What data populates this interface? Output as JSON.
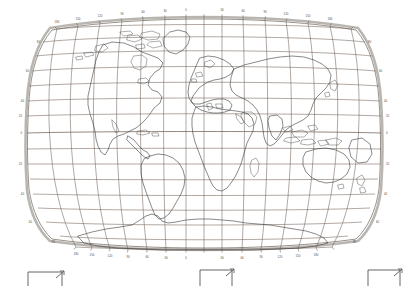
{
  "map": {
    "title": "World Map",
    "projection": "Robinson",
    "background_color": "#ffffff",
    "graticule_color": "#6b5a4e",
    "coastline_color": "#3a3a3a",
    "border_color": "#b9b6b2",
    "graticule_interval_degrees": 15,
    "label_interval_degrees": 30,
    "longitude_labels": [
      {
        "value": "180",
        "lon": -180
      },
      {
        "value": "150",
        "lon": -150
      },
      {
        "value": "120",
        "lon": -120
      },
      {
        "value": "90",
        "lon": -90
      },
      {
        "value": "60",
        "lon": -60
      },
      {
        "value": "30",
        "lon": -30
      },
      {
        "value": "0",
        "lon": 0
      },
      {
        "value": "30",
        "lon": 30
      },
      {
        "value": "60",
        "lon": 60
      },
      {
        "value": "90",
        "lon": 90
      },
      {
        "value": "120",
        "lon": 120
      },
      {
        "value": "150",
        "lon": 150
      },
      {
        "value": "180",
        "lon": 180
      }
    ],
    "latitude_labels": [
      {
        "value": "80",
        "lat": 80
      },
      {
        "value": "60",
        "lat": 60
      },
      {
        "value": "40",
        "lat": 40
      },
      {
        "value": "20",
        "lat": 20
      },
      {
        "value": "0",
        "lat": 0
      },
      {
        "value": "20",
        "lat": -20
      },
      {
        "value": "40",
        "lat": -40
      },
      {
        "value": "60",
        "lat": -60
      },
      {
        "value": "80",
        "lat": -80
      }
    ]
  },
  "legend": {
    "items": [
      {
        "name": "scale-bracket-left",
        "label": ""
      },
      {
        "name": "scale-bracket-center",
        "label": ""
      },
      {
        "name": "scale-bracket-right",
        "label": ""
      }
    ]
  }
}
